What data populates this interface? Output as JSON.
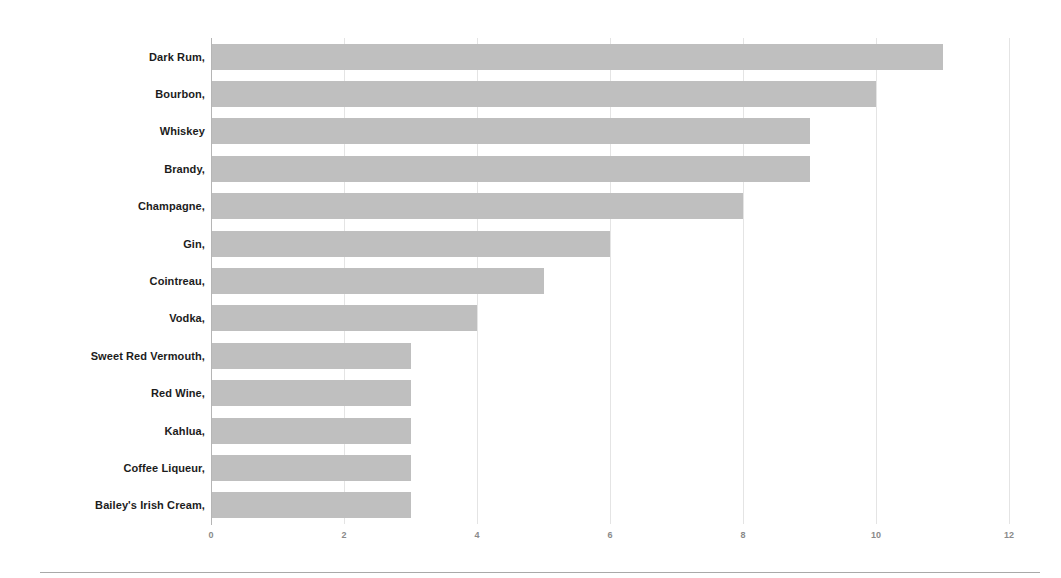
{
  "chart_data": {
    "type": "bar",
    "orientation": "horizontal",
    "title": "",
    "subtitle": "",
    "xlabel": "",
    "ylabel": "",
    "categories": [
      "Dark Rum,",
      "Bourbon,",
      "Whiskey",
      "Brandy,",
      "Champagne,",
      "Gin,",
      "Cointreau,",
      "Vodka,",
      "Sweet Red Vermouth,",
      "Red Wine,",
      "Kahlua,",
      "Coffee Liqueur,",
      "Bailey's Irish Cream,"
    ],
    "values": [
      11,
      10,
      9,
      9,
      8,
      6,
      5,
      4,
      3,
      3,
      3,
      3,
      3
    ],
    "xlim": [
      0,
      12
    ],
    "xticks": [
      0,
      2,
      4,
      6,
      8,
      10,
      12
    ],
    "xticklabels": [
      "0",
      "2",
      "4",
      "6",
      "8",
      "10",
      "12"
    ],
    "grid": "vertical",
    "legend": "none",
    "annotations": [],
    "colors": {
      "bar_fill": "#bfbfbf",
      "gridline": "#e4e4e4",
      "axis_line": "#b5b5b5",
      "category_label": "#1c1c1c",
      "tick_label": "#8a8a8a",
      "background": "#ffffff",
      "bottom_rule": "#a9a9a9"
    }
  }
}
